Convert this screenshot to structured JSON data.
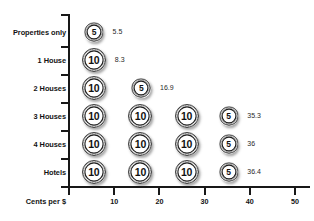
{
  "chart_data": {
    "type": "bar",
    "title": "",
    "subtitle": "",
    "xlabel": "Cents per $",
    "ylabel": "",
    "xlim": [
      0,
      50
    ],
    "grid": false,
    "legend_position": "none",
    "note": "Pictograph: each row is built from coin icons (10-cent and 5-cent) whose denominations sum to approximately the plotted value.",
    "categories": [
      "Properties only",
      "1 House",
      "2 Houses",
      "3 Houses",
      "4 Houses",
      "Hotels"
    ],
    "values": [
      5.5,
      8.3,
      16.9,
      35.3,
      36,
      36.4
    ],
    "value_labels": [
      "5.5",
      "8.3",
      "16.9",
      "35.3",
      "36",
      "36.4"
    ],
    "x_ticks": [
      0,
      10,
      20,
      30,
      40,
      50
    ],
    "x_tick_labels": [
      "",
      "10",
      "20",
      "30",
      "40",
      "50"
    ],
    "coin_glyph_ten": "10",
    "coin_glyph_five": "5",
    "rows": [
      {
        "category": "Properties only",
        "value": 5.5,
        "value_label": "5.5",
        "coins": [
          {
            "denomination": "5",
            "size": "five",
            "center": 5.5
          }
        ]
      },
      {
        "category": "1 House",
        "value": 8.3,
        "value_label": "8.3",
        "coins": [
          {
            "denomination": "10",
            "size": "ten",
            "center": 5.5
          }
        ]
      },
      {
        "category": "2 Houses",
        "value": 16.9,
        "value_label": "16.9",
        "coins": [
          {
            "denomination": "10",
            "size": "ten",
            "center": 5.5
          },
          {
            "denomination": "5",
            "size": "five",
            "center": 16.0
          }
        ]
      },
      {
        "category": "3 Houses",
        "value": 35.3,
        "value_label": "35.3",
        "coins": [
          {
            "denomination": "10",
            "size": "ten",
            "center": 5.5
          },
          {
            "denomination": "10",
            "size": "ten",
            "center": 15.8
          },
          {
            "denomination": "10",
            "size": "ten",
            "center": 26.0
          },
          {
            "denomination": "5",
            "size": "five",
            "center": 35.3
          }
        ]
      },
      {
        "category": "4 Houses",
        "value": 36,
        "value_label": "36",
        "coins": [
          {
            "denomination": "10",
            "size": "ten",
            "center": 5.5
          },
          {
            "denomination": "10",
            "size": "ten",
            "center": 15.8
          },
          {
            "denomination": "10",
            "size": "ten",
            "center": 26.0
          },
          {
            "denomination": "5",
            "size": "five",
            "center": 35.3
          }
        ]
      },
      {
        "category": "Hotels",
        "value": 36.4,
        "value_label": "36.4",
        "coins": [
          {
            "denomination": "10",
            "size": "ten",
            "center": 5.5
          },
          {
            "denomination": "10",
            "size": "ten",
            "center": 15.8
          },
          {
            "denomination": "10",
            "size": "ten",
            "center": 26.0
          },
          {
            "denomination": "5",
            "size": "five",
            "center": 35.3
          }
        ]
      }
    ]
  }
}
